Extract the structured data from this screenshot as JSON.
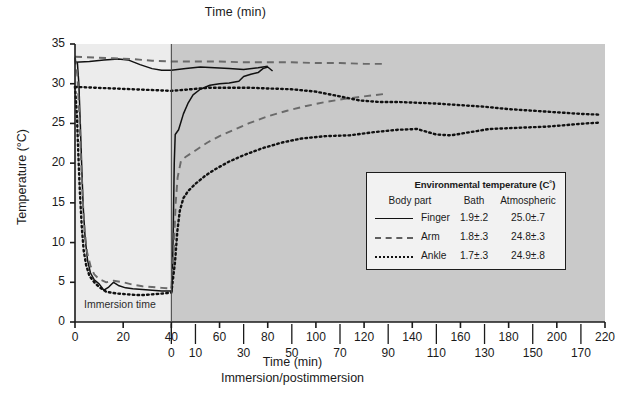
{
  "figure": {
    "top_title": "Time (min)",
    "y_title": "Temperature (°C)",
    "bottom_title": "Time (min)",
    "bottom_subtitle": "Immersion/postimmersion",
    "immersion_note": "Immersion time"
  },
  "legend": {
    "env_header": "Environmental temperature (C˚)",
    "col_body": "Body part",
    "col_bath": "Bath",
    "col_atmospheric": "Atmospheric",
    "rows": [
      {
        "name": "Finger",
        "bath": "1.9±.2",
        "atmospheric": "25.0±.7",
        "style": "solid",
        "color": "#111111"
      },
      {
        "name": "Arm",
        "bath": "1.8±.3",
        "atmospheric": "24.8±.3",
        "style": "dashed",
        "color": "#6a6a6a"
      },
      {
        "name": "Ankle",
        "bath": "1.7±.3",
        "atmospheric": "24.9±.8",
        "style": "dotted",
        "color": "#111111"
      }
    ]
  },
  "chart_data": {
    "type": "line",
    "title": "Time (min)",
    "xlabel": "Time (min)",
    "ylabel": "Temperature (°C)",
    "xlim": [
      0,
      220
    ],
    "ylim": [
      0,
      35
    ],
    "grid": false,
    "legend_position": "inside-lower-right",
    "plot_bg_immersion": "#ececec",
    "plot_bg_postimmersion": "#c9c9c9",
    "immersion_end_min": 40,
    "annotations": [
      {
        "text": "Immersion time",
        "x": 3,
        "y": 1.4
      }
    ],
    "xaxis_primary": {
      "label": "Time (min)",
      "ticks": [
        0,
        20,
        40,
        60,
        80,
        100,
        120,
        140,
        160,
        180,
        200,
        220
      ],
      "ticklabels": [
        "0",
        "20",
        "40",
        "60",
        "80",
        "100",
        "120",
        "140",
        "160",
        "180",
        "200",
        "220"
      ]
    },
    "xaxis_secondary": {
      "label": "Immersion/postimmersion",
      "offset_min": 40,
      "ticks": [
        40,
        50,
        70,
        90,
        110,
        130,
        150,
        170,
        190,
        210
      ],
      "ticklabels": [
        "0",
        "10",
        "30",
        "50",
        "70",
        "90",
        "110",
        "130",
        "150",
        "170"
      ]
    },
    "yaxis": {
      "ticks": [
        0,
        5,
        10,
        15,
        20,
        25,
        30,
        35
      ],
      "ticklabels": [
        "0",
        "5",
        "10",
        "15",
        "20",
        "25",
        "30",
        "35"
      ]
    },
    "series": [
      {
        "name": "Finger",
        "style": "solid",
        "color": "#111111",
        "points": [
          [
            0.0,
            32.8
          ],
          [
            1.0,
            32.6
          ],
          [
            1.6,
            30.0
          ],
          [
            2.2,
            25.0
          ],
          [
            2.8,
            19.5
          ],
          [
            3.4,
            14.5
          ],
          [
            4.2,
            10.6
          ],
          [
            5.2,
            7.8
          ],
          [
            6.4,
            6.2
          ],
          [
            8.0,
            5.3
          ],
          [
            10.0,
            4.8
          ],
          [
            12.0,
            4.0
          ],
          [
            14.0,
            4.4
          ],
          [
            16.0,
            5.0
          ],
          [
            18.0,
            4.6
          ],
          [
            21.0,
            4.3
          ],
          [
            24.0,
            4.2
          ],
          [
            28.0,
            4.1
          ],
          [
            32.0,
            4.0
          ],
          [
            36.0,
            3.9
          ],
          [
            39.5,
            3.9
          ],
          [
            40.3,
            3.9
          ],
          [
            40.8,
            12.0
          ],
          [
            41.2,
            20.0
          ],
          [
            41.6,
            23.6
          ],
          [
            43.0,
            24.2
          ],
          [
            45.0,
            26.2
          ],
          [
            47.0,
            27.6
          ],
          [
            49.0,
            28.6
          ],
          [
            52.0,
            29.3
          ],
          [
            56.0,
            29.8
          ],
          [
            60.0,
            30.0
          ],
          [
            64.0,
            30.1
          ],
          [
            68.0,
            30.3
          ],
          [
            70.0,
            30.9
          ],
          [
            73.0,
            31.2
          ],
          [
            76.0,
            31.4
          ],
          [
            78.0,
            31.9
          ],
          [
            80.0,
            32.1
          ],
          [
            82.0,
            31.6
          ]
        ],
        "pre_immersion_baseline": [
          [
            0.0,
            32.7
          ],
          [
            6.0,
            32.8
          ],
          [
            12.0,
            33.0
          ],
          [
            18.0,
            33.1
          ],
          [
            22.0,
            33.0
          ],
          [
            27.0,
            32.4
          ],
          [
            32.0,
            31.9
          ],
          [
            36.0,
            31.7
          ],
          [
            40.0,
            31.7
          ],
          [
            46.0,
            31.9
          ],
          [
            52.0,
            32.1
          ],
          [
            58.0,
            32.0
          ],
          [
            64.0,
            31.9
          ],
          [
            70.0,
            31.8
          ],
          [
            76.0,
            32.0
          ],
          [
            80.0,
            32.2
          ]
        ]
      },
      {
        "name": "Arm",
        "style": "dashed",
        "color": "#6a6a6a",
        "points": [
          [
            0.0,
            33.3
          ],
          [
            1.0,
            31.0
          ],
          [
            1.8,
            26.0
          ],
          [
            2.5,
            20.5
          ],
          [
            3.2,
            15.5
          ],
          [
            4.0,
            11.5
          ],
          [
            5.0,
            8.8
          ],
          [
            6.5,
            7.0
          ],
          [
            8.0,
            6.0
          ],
          [
            10.0,
            5.4
          ],
          [
            13.0,
            5.0
          ],
          [
            16.0,
            5.2
          ],
          [
            20.0,
            5.0
          ],
          [
            24.0,
            4.7
          ],
          [
            28.0,
            4.5
          ],
          [
            32.0,
            4.4
          ],
          [
            36.0,
            4.3
          ],
          [
            40.0,
            4.2
          ],
          [
            41.0,
            9.0
          ],
          [
            41.8,
            15.0
          ],
          [
            42.6,
            18.2
          ],
          [
            44.0,
            20.3
          ],
          [
            46.0,
            20.8
          ],
          [
            50.0,
            21.6
          ],
          [
            55.0,
            22.6
          ],
          [
            60.0,
            23.4
          ],
          [
            66.0,
            24.2
          ],
          [
            72.0,
            25.0
          ],
          [
            80.0,
            25.9
          ],
          [
            88.0,
            26.6
          ],
          [
            96.0,
            27.2
          ],
          [
            104.0,
            27.7
          ],
          [
            112.0,
            28.1
          ],
          [
            120.0,
            28.4
          ],
          [
            128.0,
            28.7
          ]
        ],
        "pre_immersion_baseline": [
          [
            0.0,
            33.4
          ],
          [
            8.0,
            33.3
          ],
          [
            16.0,
            33.2
          ],
          [
            24.0,
            33.1
          ],
          [
            32.0,
            32.9
          ],
          [
            40.0,
            32.8
          ],
          [
            50.0,
            32.8
          ],
          [
            60.0,
            32.8
          ],
          [
            70.0,
            32.7
          ],
          [
            80.0,
            32.7
          ],
          [
            90.0,
            32.7
          ],
          [
            100.0,
            32.6
          ],
          [
            110.0,
            32.6
          ],
          [
            120.0,
            32.5
          ],
          [
            128.0,
            32.5
          ]
        ]
      },
      {
        "name": "Ankle",
        "style": "dotted",
        "color": "#111111",
        "points": [
          [
            0.0,
            29.6
          ],
          [
            0.8,
            26.0
          ],
          [
            1.4,
            21.0
          ],
          [
            2.0,
            16.5
          ],
          [
            2.8,
            12.0
          ],
          [
            3.6,
            9.0
          ],
          [
            4.6,
            7.2
          ],
          [
            6.0,
            5.8
          ],
          [
            8.0,
            5.0
          ],
          [
            10.0,
            4.4
          ],
          [
            13.0,
            3.8
          ],
          [
            17.0,
            3.6
          ],
          [
            21.0,
            3.5
          ],
          [
            25.0,
            3.4
          ],
          [
            29.0,
            3.4
          ],
          [
            33.0,
            3.5
          ],
          [
            37.0,
            3.6
          ],
          [
            40.0,
            3.7
          ],
          [
            41.5,
            7.5
          ],
          [
            42.5,
            11.5
          ],
          [
            43.5,
            14.0
          ],
          [
            45.0,
            15.6
          ],
          [
            47.0,
            16.5
          ],
          [
            50.0,
            17.4
          ],
          [
            54.0,
            18.4
          ],
          [
            58.0,
            19.2
          ],
          [
            64.0,
            20.2
          ],
          [
            70.0,
            21.0
          ],
          [
            78.0,
            21.9
          ],
          [
            86.0,
            22.6
          ],
          [
            94.0,
            23.1
          ],
          [
            104.0,
            23.4
          ],
          [
            114.0,
            23.5
          ],
          [
            124.0,
            23.9
          ],
          [
            134.0,
            24.2
          ],
          [
            142.0,
            24.3
          ],
          [
            150.0,
            23.6
          ],
          [
            156.0,
            23.5
          ],
          [
            164.0,
            23.9
          ],
          [
            172.0,
            24.3
          ],
          [
            180.0,
            24.4
          ],
          [
            188.0,
            24.5
          ],
          [
            196.0,
            24.6
          ],
          [
            204.0,
            24.8
          ],
          [
            212.0,
            25.0
          ],
          [
            218.0,
            25.1
          ]
        ],
        "pre_immersion_baseline": [
          [
            0.0,
            29.6
          ],
          [
            8.0,
            29.5
          ],
          [
            16.0,
            29.4
          ],
          [
            24.0,
            29.3
          ],
          [
            32.0,
            29.2
          ],
          [
            40.0,
            29.1
          ],
          [
            48.0,
            29.3
          ],
          [
            56.0,
            29.5
          ],
          [
            64.0,
            29.5
          ],
          [
            72.0,
            29.5
          ],
          [
            80.0,
            29.4
          ],
          [
            90.0,
            29.3
          ],
          [
            100.0,
            29.0
          ],
          [
            110.0,
            28.4
          ],
          [
            118.0,
            27.9
          ],
          [
            126.0,
            27.7
          ],
          [
            134.0,
            27.7
          ],
          [
            142.0,
            27.6
          ],
          [
            150.0,
            27.5
          ],
          [
            160.0,
            27.3
          ],
          [
            170.0,
            27.1
          ],
          [
            180.0,
            26.8
          ],
          [
            190.0,
            26.6
          ],
          [
            200.0,
            26.4
          ],
          [
            210.0,
            26.2
          ],
          [
            218.0,
            26.1
          ]
        ]
      }
    ]
  }
}
